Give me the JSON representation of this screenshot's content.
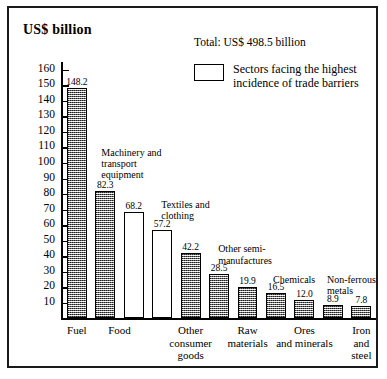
{
  "figure": {
    "y_axis_title": "US$ billion",
    "legend_total": "Total: US$ 498.5 billion",
    "legend_entry_label": "Sectors facing the highest\nincidence of trade barriers"
  },
  "chart_data": {
    "type": "bar",
    "title": "",
    "subtitle": "Total: US$ 498.5 billion",
    "xlabel": "",
    "ylabel": "US$ billion",
    "ylim": [
      0,
      165
    ],
    "grid": false,
    "legend_position": "top-right",
    "legend": [
      {
        "label": "Sectors facing the highest incidence of trade barriers",
        "fill": "open"
      }
    ],
    "yticks": [
      10,
      20,
      30,
      40,
      50,
      60,
      70,
      80,
      90,
      100,
      110,
      120,
      130,
      140,
      150,
      160
    ],
    "ytick_labels": [
      "10",
      "20",
      "30",
      "40",
      "50",
      "60",
      "70",
      "80",
      "90",
      "100",
      "110",
      "120",
      "130",
      "140",
      "150",
      "160"
    ],
    "categories": [
      "Fuel",
      "Food",
      "Other\nconsumer\ngoods",
      "Raw\nmaterials",
      "Ores\nand minerals",
      "Iron\nand steel"
    ],
    "bars": [
      {
        "value": 148.2,
        "label": "148.2",
        "fill": "hatched",
        "series": "Fuel"
      },
      {
        "value": 82.3,
        "label": "82.3",
        "fill": "hatched",
        "series": "Machinery and transport equipment"
      },
      {
        "value": 68.2,
        "label": "68.2",
        "fill": "open",
        "series": "Food"
      },
      {
        "value": 57.2,
        "label": "57.2",
        "fill": "open",
        "series": "Textiles and clothing"
      },
      {
        "value": 42.2,
        "label": "42.2",
        "fill": "hatched",
        "series": "Other consumer goods"
      },
      {
        "value": 28.5,
        "label": "28.5",
        "fill": "hatched",
        "series": "Other semi-manufactures"
      },
      {
        "value": 19.9,
        "label": "19.9",
        "fill": "hatched",
        "series": "Raw materials"
      },
      {
        "value": 16.5,
        "label": "16.5",
        "fill": "hatched",
        "series": "Chemicals"
      },
      {
        "value": 12.0,
        "label": "12.0",
        "fill": "hatched",
        "series": "Ores and minerals"
      },
      {
        "value": 8.9,
        "label": "8.9",
        "fill": "hatched",
        "series": "Non-ferrous metals"
      },
      {
        "value": 7.8,
        "label": "7.8",
        "fill": "hatched",
        "series": "Iron and steel"
      }
    ],
    "annotations": [
      {
        "text": "Machinery and\ntransport\nequipment"
      },
      {
        "text": "Textiles and\nclothing"
      },
      {
        "text": "Other semi-\nmanufactures"
      },
      {
        "text": "Chemicals"
      },
      {
        "text": "Non-ferrous\nmetals"
      }
    ]
  }
}
